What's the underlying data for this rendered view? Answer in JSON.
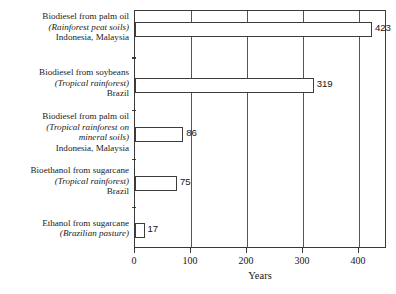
{
  "chart_data": {
    "type": "bar",
    "orientation": "horizontal",
    "title": "",
    "xlabel": "Years",
    "ylabel": "",
    "xlim": [
      0,
      450
    ],
    "xticks": [
      0,
      100,
      200,
      300,
      400
    ],
    "grid": "vertical",
    "legend": "none",
    "categories": [
      "Biodiesel from palm oil (Rainforest peat soils) Indonesia, Malaysia",
      "Biodiesel from soybeans (Tropical rainforest) Brazil",
      "Biodiesel from palm oil (Tropical rainforest on mineral soils) Indonesia, Malaysia",
      "Bioethanol from sugarcane (Tropical rainforest) Brazil",
      "Ethanol from sugarcane (Brazilian pasture)"
    ],
    "values": [
      423,
      319,
      86,
      75,
      17
    ],
    "value_labels": [
      "423",
      "319",
      "86",
      "75",
      "17"
    ],
    "bar_fill_color": "#ffffff",
    "bar_border_color": "#3d3d3d",
    "gridline_color": "#555555",
    "axis_color": "#3a3a3a"
  },
  "categories": [
    {
      "lines": [
        {
          "text": "Biodiesel from palm oil",
          "italic": false
        },
        {
          "text": "(Rainforest peat soils)",
          "italic": true
        },
        {
          "text": "Indonesia, Malaysia",
          "italic": false
        }
      ],
      "value": 423,
      "value_label": "423"
    },
    {
      "lines": [
        {
          "text": "Biodiesel from soybeans",
          "italic": false
        },
        {
          "text": "(Tropical rainforest)",
          "italic": true
        },
        {
          "text": "Brazil",
          "italic": false
        }
      ],
      "value": 319,
      "value_label": "319"
    },
    {
      "lines": [
        {
          "text": "Biodiesel from palm oil",
          "italic": false
        },
        {
          "text": "(Tropical rainforest on",
          "italic": true
        },
        {
          "text": "mineral soils)",
          "italic": true
        },
        {
          "text": "Indonesia, Malaysia",
          "italic": false
        }
      ],
      "value": 86,
      "value_label": "86"
    },
    {
      "lines": [
        {
          "text": "Bioethanol from sugarcane",
          "italic": false
        },
        {
          "text": "(Tropical rainforest)",
          "italic": true
        },
        {
          "text": "Brazil",
          "italic": false
        }
      ],
      "value": 75,
      "value_label": "75"
    },
    {
      "lines": [
        {
          "text": "Ethanol from sugarcane",
          "italic": false
        },
        {
          "text": "(Brazilian pasture)",
          "italic": true
        }
      ],
      "value": 17,
      "value_label": "17"
    }
  ],
  "axis": {
    "title": "Years",
    "ticks": [
      "0",
      "100",
      "200",
      "300",
      "400"
    ]
  }
}
